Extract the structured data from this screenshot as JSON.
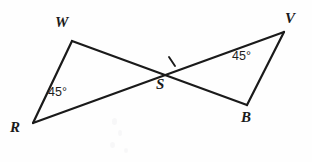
{
  "figure": {
    "background_color": "#fefefe",
    "stroke_color": "#1a1a1a",
    "vertices": [
      {
        "name": "W",
        "label": "W",
        "x": 72,
        "y": 41,
        "label_x": 55,
        "label_y": 15
      },
      {
        "name": "V",
        "label": "V",
        "x": 284,
        "y": 32,
        "label_x": 285,
        "label_y": 11
      },
      {
        "name": "R",
        "label": "R",
        "x": 33,
        "y": 123,
        "label_x": 10,
        "label_y": 120
      },
      {
        "name": "B",
        "label": "B",
        "x": 247,
        "y": 105,
        "label_x": 241,
        "label_y": 110
      },
      {
        "name": "S",
        "label": "S",
        "x": 160,
        "y": 74,
        "label_x": 156,
        "label_y": 77
      }
    ],
    "segments": [
      {
        "name": "segment-W-R",
        "from": "W",
        "to": "R"
      },
      {
        "name": "segment-W-S-B",
        "from": "W",
        "to": "B"
      },
      {
        "name": "segment-R-S-V",
        "from": "R",
        "to": "V"
      },
      {
        "name": "segment-V-B",
        "from": "V",
        "to": "B"
      }
    ],
    "angle_marks": [
      {
        "name": "angle-R",
        "value": "45°",
        "x": 48,
        "y": 86
      },
      {
        "name": "angle-V",
        "value": "45°",
        "x": 232,
        "y": 50
      }
    ],
    "tick_marks": [
      {
        "name": "tick-segment-S-V",
        "x": 172,
        "y": 62
      }
    ]
  }
}
